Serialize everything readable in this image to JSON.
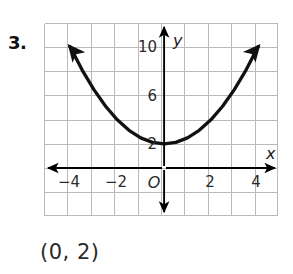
{
  "problem": {
    "number": "3.",
    "answer_text": "(0, 2)"
  },
  "graph": {
    "x_axis_label": "x",
    "y_axis_label": "y",
    "origin_label": "O",
    "x_tick_labels": [
      "−4",
      "−2",
      "2",
      "4"
    ],
    "y_tick_labels": [
      "10",
      "6",
      "2"
    ],
    "grid_color": "#b9b9b9",
    "axis_color": "#000000",
    "curve_color": "#111111"
  },
  "chart_data": {
    "type": "line",
    "title": "",
    "xlabel": "x",
    "ylabel": "y",
    "equation": "y = 0.5x^2 + 2",
    "vertex": [
      0,
      2
    ],
    "xlim": [
      -5,
      5
    ],
    "ylim": [
      -2,
      12
    ],
    "grid": true,
    "x_ticks": [
      -4,
      -2,
      0,
      2,
      4
    ],
    "y_ticks": [
      2,
      6,
      10
    ],
    "x": [
      -4,
      -3.5,
      -3,
      -2.5,
      -2,
      -1.5,
      -1,
      -0.5,
      0,
      0.5,
      1,
      1.5,
      2,
      2.5,
      3,
      3.5,
      4
    ],
    "y": [
      10,
      8.125,
      6.5,
      5.125,
      4,
      3.125,
      2.5,
      2.125,
      2,
      2.125,
      2.5,
      3.125,
      4,
      5.125,
      6.5,
      8.125,
      10
    ],
    "legend": [],
    "annotations": [
      "Vertex at (0, 2)"
    ]
  }
}
